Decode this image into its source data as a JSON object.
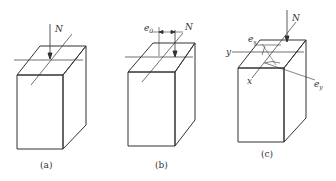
{
  "figure": {
    "panels": [
      {
        "id": "a",
        "caption": "(a)",
        "force_label": "N"
      },
      {
        "id": "b",
        "caption": "(b)",
        "force_label": "N",
        "eccentricity_label": "e",
        "eccentricity_sub": "0"
      },
      {
        "id": "c",
        "caption": "(c)",
        "force_label": "N",
        "ex_label": "e",
        "ex_sub": "x",
        "ey_label": "e",
        "ey_sub": "y",
        "x_axis_label": "x",
        "y_axis_label": "y"
      }
    ],
    "colors": {
      "line": "#333333",
      "background": "#ffffff"
    }
  }
}
